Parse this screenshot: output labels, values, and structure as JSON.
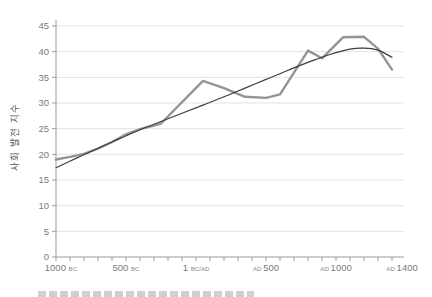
{
  "page": {
    "background": "#ffffff"
  },
  "colors": {
    "grid": "#e3e3e3",
    "axis": "#9b9b9b",
    "tick_label": "#7a7a7a",
    "era_label": "#8a8a8a",
    "y_axis_title": "#555555",
    "series_gray": "#949494",
    "series_dark": "#3d3d3d"
  },
  "chart_data": {
    "type": "line",
    "title": "",
    "xlabel": "",
    "ylabel": "사회 발전 지수",
    "ylim": [
      0,
      45
    ],
    "ytick_step": 5,
    "yticks": [
      0,
      5,
      10,
      15,
      20,
      25,
      30,
      35,
      40,
      45
    ],
    "xlim_years": [
      -1000,
      1400
    ],
    "x_minor_tick_interval_years": 100,
    "grid": "horizontal-only",
    "legend": "none",
    "xticks": [
      {
        "year": -1000,
        "num": "1000",
        "era": "BC",
        "era_position": "after",
        "x_override": 61
      },
      {
        "year": -500,
        "num": "500",
        "era": "BC",
        "era_position": "after"
      },
      {
        "year": 1,
        "num": "1",
        "era": "BC/AD",
        "era_position": "after"
      },
      {
        "year": 500,
        "num": "500",
        "era": "AD",
        "era_position": "before"
      },
      {
        "year": 1000,
        "num": "1000",
        "era": "AD",
        "era_position": "before"
      },
      {
        "year": 1400,
        "num": "1400",
        "era": "AD",
        "era_position": "before",
        "x_override": 402
      }
    ],
    "series": [
      {
        "name": "social-development-index",
        "style": "thick-gray",
        "color": "#949494",
        "stroke_width": 2.4,
        "smooth": false,
        "points": [
          [
            -1000,
            19.0
          ],
          [
            -900,
            19.5
          ],
          [
            -800,
            20.1
          ],
          [
            -700,
            21.1
          ],
          [
            -600,
            22.4
          ],
          [
            -500,
            23.9
          ],
          [
            -400,
            24.9
          ],
          [
            -300,
            25.6
          ],
          [
            -250,
            26.0
          ],
          [
            50,
            34.3
          ],
          [
            200,
            32.9
          ],
          [
            350,
            31.2
          ],
          [
            500,
            31.0
          ],
          [
            600,
            31.7
          ],
          [
            800,
            40.2
          ],
          [
            900,
            38.7
          ],
          [
            1050,
            42.8
          ],
          [
            1200,
            42.9
          ],
          [
            1300,
            40.6
          ],
          [
            1400,
            36.5
          ]
        ]
      },
      {
        "name": "smooth-trend",
        "style": "thin-dark",
        "color": "#3d3d3d",
        "stroke_width": 1.2,
        "smooth": true,
        "points": [
          [
            -1000,
            17.4
          ],
          [
            -850,
            19.3
          ],
          [
            -700,
            21.2
          ],
          [
            -550,
            23.0
          ],
          [
            -400,
            24.8
          ],
          [
            -250,
            26.4
          ],
          [
            -100,
            28.0
          ],
          [
            50,
            29.6
          ],
          [
            200,
            31.2
          ],
          [
            350,
            32.9
          ],
          [
            500,
            34.6
          ],
          [
            650,
            36.3
          ],
          [
            800,
            37.9
          ],
          [
            950,
            39.4
          ],
          [
            1100,
            40.5
          ],
          [
            1200,
            40.7
          ],
          [
            1300,
            40.3
          ],
          [
            1400,
            38.9
          ]
        ]
      }
    ]
  }
}
